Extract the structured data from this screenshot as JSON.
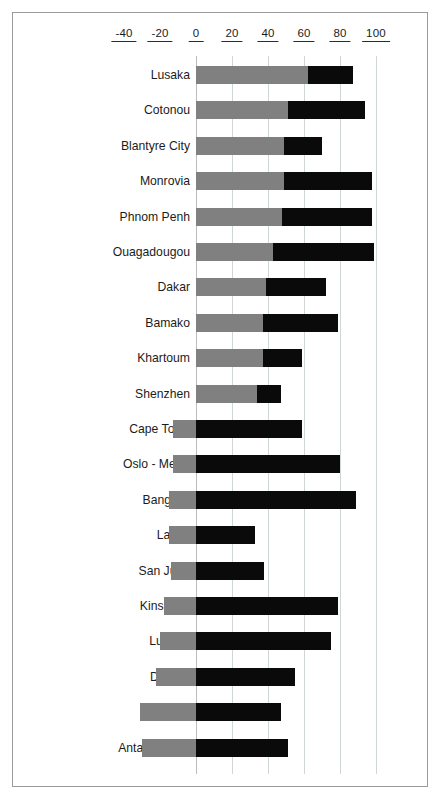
{
  "chart_data": {
    "type": "bar",
    "orientation": "horizontal",
    "stacked": true,
    "title": "",
    "xlabel": "",
    "ylabel": "",
    "xlim": [
      -48,
      110
    ],
    "xticks": [
      -40,
      -20,
      0,
      20,
      40,
      60,
      80,
      100
    ],
    "xtick_labels": [
      "-40",
      "-20",
      "0",
      "20",
      "40",
      "60",
      "80",
      "100"
    ],
    "grid": true,
    "legend": "none",
    "colors": {
      "series_gray": "#808080",
      "series_black": "#0a0a0a",
      "gridline": "#cfd6d6",
      "frame": "#9a9a9a",
      "text": "#1c1c1c"
    },
    "categories": [
      "Lusaka",
      "Cotonou",
      "Blantyre City",
      "Monrovia",
      "Phnom Penh",
      "Ouagadougou",
      "Dakar",
      "Bamako",
      "Khartoum",
      "Shenzhen",
      "Cape Town",
      "Oslo  - Metro",
      "Bangkok",
      "Lagos",
      "San Juan",
      "Kinshasa",
      "Luanda",
      "Durban",
      "Yaoundé",
      "Antananarivo"
    ],
    "series": [
      {
        "name": "gray",
        "color": "#808080",
        "values": [
          62,
          51,
          49,
          49,
          48,
          43,
          39,
          37,
          37,
          34,
          -13,
          -13,
          -15,
          -15,
          -14,
          -18,
          -20,
          -22,
          -31,
          -30
        ]
      },
      {
        "name": "black",
        "color": "#0a0a0a",
        "values": [
          25,
          43,
          21,
          49,
          50,
          56,
          33,
          42,
          22,
          13,
          59,
          80,
          89,
          33,
          38,
          79,
          75,
          55,
          47,
          51
        ]
      }
    ],
    "bars": [
      {
        "category": "Lusaka",
        "gray_start": 0,
        "gray_end": 62,
        "black_start": 62,
        "black_end": 87
      },
      {
        "category": "Cotonou",
        "gray_start": 0,
        "gray_end": 51,
        "black_start": 51,
        "black_end": 94
      },
      {
        "category": "Blantyre City",
        "gray_start": 0,
        "gray_end": 49,
        "black_start": 49,
        "black_end": 70
      },
      {
        "category": "Monrovia",
        "gray_start": 0,
        "gray_end": 49,
        "black_start": 49,
        "black_end": 98
      },
      {
        "category": "Phnom Penh",
        "gray_start": 0,
        "gray_end": 48,
        "black_start": 48,
        "black_end": 98
      },
      {
        "category": "Ouagadougou",
        "gray_start": 0,
        "gray_end": 43,
        "black_start": 43,
        "black_end": 99
      },
      {
        "category": "Dakar",
        "gray_start": 0,
        "gray_end": 39,
        "black_start": 39,
        "black_end": 72
      },
      {
        "category": "Bamako",
        "gray_start": 0,
        "gray_end": 37,
        "black_start": 37,
        "black_end": 79
      },
      {
        "category": "Khartoum",
        "gray_start": 0,
        "gray_end": 37,
        "black_start": 37,
        "black_end": 59
      },
      {
        "category": "Shenzhen",
        "gray_start": 0,
        "gray_end": 34,
        "black_start": 34,
        "black_end": 47
      },
      {
        "category": "Cape Town",
        "gray_start": -13,
        "gray_end": 0,
        "black_start": 0,
        "black_end": 59
      },
      {
        "category": "Oslo  - Metro",
        "gray_start": -13,
        "gray_end": 0,
        "black_start": 0,
        "black_end": 80
      },
      {
        "category": "Bangkok",
        "gray_start": -15,
        "gray_end": 0,
        "black_start": 0,
        "black_end": 89
      },
      {
        "category": "Lagos",
        "gray_start": -15,
        "gray_end": 0,
        "black_start": 0,
        "black_end": 33
      },
      {
        "category": "San Juan",
        "gray_start": -14,
        "gray_end": 0,
        "black_start": 0,
        "black_end": 38
      },
      {
        "category": "Kinshasa",
        "gray_start": -18,
        "gray_end": 0,
        "black_start": 0,
        "black_end": 79
      },
      {
        "category": "Luanda",
        "gray_start": -20,
        "gray_end": 0,
        "black_start": 0,
        "black_end": 75
      },
      {
        "category": "Durban",
        "gray_start": -22,
        "gray_end": 0,
        "black_start": 0,
        "black_end": 55
      },
      {
        "category": "Yaoundé",
        "gray_start": -31,
        "gray_end": 0,
        "black_start": 0,
        "black_end": 47
      },
      {
        "category": "Antananarivo",
        "gray_start": -30,
        "gray_end": 0,
        "black_start": 0,
        "black_end": 51
      }
    ]
  }
}
